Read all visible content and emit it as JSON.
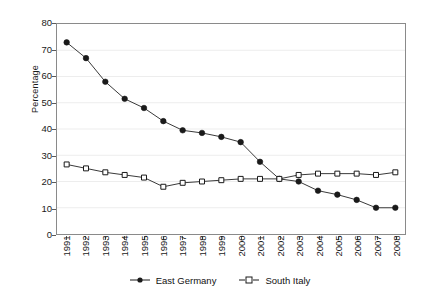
{
  "chart_data": {
    "type": "line",
    "title": "",
    "xlabel": "",
    "ylabel": "Percentage",
    "ylim": [
      0,
      80
    ],
    "y_ticks": [
      0,
      10,
      20,
      30,
      40,
      50,
      60,
      70,
      80
    ],
    "grid": true,
    "grid_axis": "y",
    "legend_position": "bottom",
    "categories": [
      "1991",
      "1992",
      "1993",
      "1994",
      "1995",
      "1996",
      "1997",
      "1998",
      "1999",
      "2000",
      "2001",
      "2002",
      "2003",
      "2004",
      "2005",
      "2006",
      "2007",
      "2008"
    ],
    "series": [
      {
        "name": "East Germany",
        "marker": "filled-circle",
        "color": "#1a1a1a",
        "values": [
          73,
          67,
          58,
          51.5,
          48,
          43,
          39.5,
          38.5,
          37,
          35,
          27.5,
          21,
          20,
          16.5,
          15,
          13,
          10,
          10
        ]
      },
      {
        "name": "South Italy",
        "marker": "open-square",
        "color": "#1a1a1a",
        "values": [
          26.5,
          25,
          23.5,
          22.5,
          21.5,
          18,
          19.5,
          20,
          20.5,
          21,
          21,
          21,
          22.5,
          23,
          23,
          23,
          22.5,
          23.5
        ]
      }
    ]
  },
  "legend": {
    "items": [
      {
        "label": "East Germany",
        "marker": "filled-circle"
      },
      {
        "label": "South Italy",
        "marker": "open-square"
      }
    ]
  },
  "colors": {
    "series_line": "#3a3a3a",
    "frame": "#8a8a8a",
    "grid": "#ededed",
    "text": "#1a1a1a",
    "background": "#ffffff"
  }
}
